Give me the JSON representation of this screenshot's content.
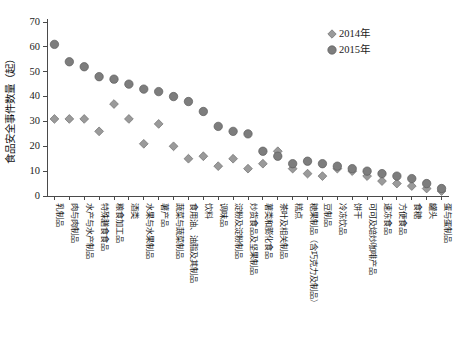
{
  "chart_data": {
    "type": "scatter",
    "title": "",
    "xlabel": "",
    "ylabel": "食品安全事件数量（起）",
    "ylim": [
      0,
      70
    ],
    "ytick_labels": [
      "0",
      "10",
      "20",
      "30",
      "40",
      "50",
      "60",
      "70"
    ],
    "ytick_values": [
      0,
      10,
      20,
      30,
      40,
      50,
      60,
      70
    ],
    "grid": false,
    "legend_position": "top-right",
    "categories": [
      "乳制品",
      "肉与肉制品",
      "水产与水产制品",
      "特殊膳食食品",
      "粮食加工品",
      "酒类",
      "水果与水果制品",
      "薯产品",
      "蔬菜与蔬菜制品",
      "食用油、油脂及其制品",
      "饮料",
      "调味品",
      "淀粉及淀粉制品",
      "炒货食品及坚果制品",
      "薯类和膨化食品",
      "茶叶及相关制品",
      "糕点",
      "糖果制品（含巧克力及制品）",
      "豆制品",
      "冷冻饮品",
      "饼干",
      "可可及焙炒咖啡产品",
      "速冻食品",
      "方便食品",
      "食糖",
      "罐头",
      "蛋与蛋制品"
    ],
    "series": [
      {
        "name": "2014年",
        "marker": "diamond",
        "color": "#9a9a9a",
        "values": [
          31,
          31,
          31,
          26,
          37,
          31,
          21,
          29,
          20,
          15,
          16,
          12,
          15,
          11,
          13,
          18,
          11,
          9,
          8,
          11,
          10,
          8,
          6,
          5,
          4,
          3,
          2
        ]
      },
      {
        "name": "2015年",
        "marker": "circle",
        "color": "#7d7d7d",
        "values": [
          61,
          54,
          52,
          48,
          47,
          45,
          43,
          42,
          40,
          38,
          34,
          28,
          26,
          25,
          18,
          16,
          13,
          14,
          13,
          12,
          11,
          10,
          9,
          8,
          7,
          5,
          3
        ]
      }
    ]
  },
  "legend": {
    "items": [
      {
        "label": "2014年",
        "marker": "diamond"
      },
      {
        "label": "2015年",
        "marker": "circle"
      }
    ]
  }
}
